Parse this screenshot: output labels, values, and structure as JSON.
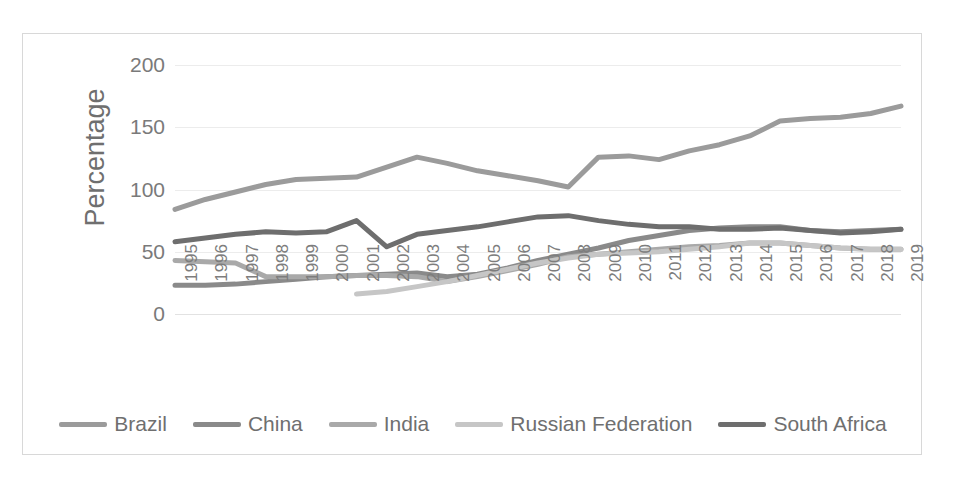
{
  "chart_data": {
    "type": "line",
    "title": "",
    "xlabel": "",
    "ylabel": "Percentage",
    "ylim": [
      0,
      200
    ],
    "yticks": [
      0,
      50,
      100,
      150,
      200
    ],
    "grid": true,
    "legend_position": "bottom",
    "x": [
      1995,
      1996,
      1997,
      1998,
      1999,
      2000,
      2001,
      2002,
      2003,
      2004,
      2005,
      2006,
      2007,
      2008,
      2009,
      2010,
      2011,
      2012,
      2013,
      2014,
      2015,
      2016,
      2017,
      2018,
      2019
    ],
    "categories": [
      "1995",
      "1996",
      "1997",
      "1998",
      "1999",
      "2000",
      "2001",
      "2002",
      "2003",
      "2004",
      "2005",
      "2006",
      "2007",
      "2008",
      "2009",
      "2010",
      "2011",
      "2012",
      "2013",
      "2014",
      "2015",
      "2016",
      "2017",
      "2018",
      "2019"
    ],
    "series": [
      {
        "name": "Brazil",
        "color": "#9b9b9b",
        "values": [
          84,
          92,
          98,
          104,
          108,
          109,
          110,
          118,
          126,
          121,
          115,
          111,
          107,
          102,
          126,
          127,
          124,
          131,
          136,
          143,
          155,
          157,
          158,
          161,
          167
        ]
      },
      {
        "name": "China",
        "color": "#8a8a8a",
        "values": [
          23,
          23,
          24,
          26,
          28,
          30,
          31,
          32,
          33,
          30,
          32,
          37,
          43,
          48,
          53,
          59,
          63,
          67,
          69,
          70,
          70,
          67,
          66,
          67,
          68
        ]
      },
      {
        "name": "India",
        "color": "#a9a9a9",
        "values": [
          43,
          42,
          41,
          30,
          30,
          30,
          31,
          31,
          30,
          26,
          30,
          35,
          40,
          46,
          48,
          50,
          52,
          54,
          55,
          57,
          57,
          55,
          53,
          52,
          52
        ]
      },
      {
        "name": "Russian Federation",
        "color": "#c6c6c6",
        "values": [
          null,
          null,
          null,
          null,
          null,
          null,
          16,
          18,
          22,
          26,
          31,
          36,
          41,
          45,
          48,
          49,
          50,
          52,
          54,
          57,
          57,
          55,
          53,
          52,
          52
        ]
      },
      {
        "name": "South Africa",
        "color": "#6e6e6e",
        "values": [
          58,
          61,
          64,
          66,
          65,
          66,
          75,
          54,
          64,
          67,
          70,
          74,
          78,
          79,
          75,
          72,
          70,
          70,
          68,
          68,
          69,
          67,
          65,
          66,
          68
        ]
      }
    ]
  },
  "axis": {
    "y_title": "Percentage",
    "y_tick_labels": [
      "200",
      "150",
      "100",
      "50",
      "0"
    ],
    "x_tick_labels": [
      "1995",
      "1996",
      "1997",
      "1998",
      "1999",
      "2000",
      "2001",
      "2002",
      "2003",
      "2004",
      "2005",
      "2006",
      "2007",
      "2008",
      "2009",
      "2010",
      "2011",
      "2012",
      "2013",
      "2014",
      "2015",
      "2016",
      "2017",
      "2018",
      "2019"
    ]
  },
  "legend": {
    "items": [
      {
        "label": "Brazil",
        "color": "#9b9b9b"
      },
      {
        "label": "China",
        "color": "#8a8a8a"
      },
      {
        "label": "India",
        "color": "#a9a9a9"
      },
      {
        "label": "Russian Federation",
        "color": "#c6c6c6"
      },
      {
        "label": "South Africa",
        "color": "#6e6e6e"
      }
    ]
  },
  "colors": {
    "gridline": "#ececec",
    "tick_text": "#7a7a7a",
    "frame_border": "#d8d8d8",
    "background": "#ffffff"
  }
}
